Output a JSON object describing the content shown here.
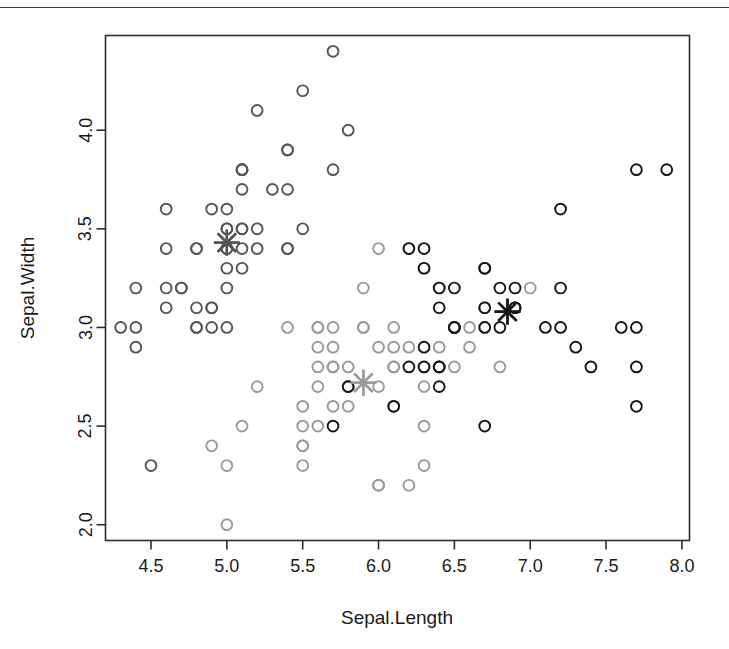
{
  "figure": {
    "background_color": "#ffffff",
    "frame_color": "#2b2b2b",
    "scan_artifact_line": true
  },
  "chart_data": {
    "type": "scatter",
    "title": "",
    "xlabel": "Sepal.Length",
    "ylabel": "Sepal.Width",
    "xlim": [
      4.2,
      8.05
    ],
    "ylim": [
      1.92,
      4.48
    ],
    "xticks": [
      4.5,
      5.0,
      5.5,
      6.0,
      6.5,
      7.0,
      7.5,
      8.0
    ],
    "xtick_labels": [
      "4.5",
      "5.0",
      "5.5",
      "6.0",
      "6.5",
      "7.0",
      "7.5",
      "8.0"
    ],
    "yticks": [
      2.0,
      2.5,
      3.0,
      3.5,
      4.0
    ],
    "ytick_labels": [
      "2.0",
      "2.5",
      "3.0",
      "3.5",
      "4.0"
    ],
    "grid": false,
    "legend": "none",
    "marker": "open-circle",
    "series": [
      {
        "name": "cluster-1",
        "color": "#555555",
        "points": [
          [
            5.1,
            3.5
          ],
          [
            4.9,
            3.0
          ],
          [
            4.7,
            3.2
          ],
          [
            4.6,
            3.1
          ],
          [
            5.0,
            3.6
          ],
          [
            5.4,
            3.9
          ],
          [
            4.6,
            3.4
          ],
          [
            5.0,
            3.4
          ],
          [
            4.4,
            2.9
          ],
          [
            4.9,
            3.1
          ],
          [
            5.4,
            3.7
          ],
          [
            4.8,
            3.4
          ],
          [
            4.8,
            3.0
          ],
          [
            4.3,
            3.0
          ],
          [
            5.8,
            4.0
          ],
          [
            5.7,
            4.4
          ],
          [
            5.4,
            3.9
          ],
          [
            5.1,
            3.5
          ],
          [
            5.7,
            3.8
          ],
          [
            5.1,
            3.8
          ],
          [
            5.4,
            3.4
          ],
          [
            5.1,
            3.7
          ],
          [
            4.6,
            3.6
          ],
          [
            5.1,
            3.3
          ],
          [
            4.8,
            3.4
          ],
          [
            5.0,
            3.0
          ],
          [
            5.0,
            3.4
          ],
          [
            5.2,
            3.5
          ],
          [
            5.2,
            3.4
          ],
          [
            4.7,
            3.2
          ],
          [
            4.8,
            3.1
          ],
          [
            5.4,
            3.4
          ],
          [
            5.2,
            4.1
          ],
          [
            5.5,
            4.2
          ],
          [
            4.9,
            3.1
          ],
          [
            5.0,
            3.2
          ],
          [
            5.5,
            3.5
          ],
          [
            4.9,
            3.6
          ],
          [
            4.4,
            3.0
          ],
          [
            5.1,
            3.4
          ],
          [
            5.0,
            3.5
          ],
          [
            4.5,
            2.3
          ],
          [
            4.4,
            3.2
          ],
          [
            5.0,
            3.5
          ],
          [
            5.1,
            3.8
          ],
          [
            4.8,
            3.0
          ],
          [
            5.1,
            3.8
          ],
          [
            4.6,
            3.2
          ],
          [
            5.3,
            3.7
          ],
          [
            5.0,
            3.3
          ]
        ]
      },
      {
        "name": "cluster-2",
        "color": "#9a9a9a",
        "points": [
          [
            7.0,
            3.2
          ],
          [
            6.4,
            3.2
          ],
          [
            6.9,
            3.1
          ],
          [
            5.5,
            2.3
          ],
          [
            6.5,
            2.8
          ],
          [
            5.7,
            2.8
          ],
          [
            6.3,
            3.3
          ],
          [
            4.9,
            2.4
          ],
          [
            6.6,
            2.9
          ],
          [
            5.2,
            2.7
          ],
          [
            5.0,
            2.0
          ],
          [
            5.9,
            3.0
          ],
          [
            6.0,
            2.2
          ],
          [
            6.1,
            2.9
          ],
          [
            5.6,
            2.9
          ],
          [
            6.7,
            3.1
          ],
          [
            5.6,
            3.0
          ],
          [
            5.8,
            2.7
          ],
          [
            6.2,
            2.2
          ],
          [
            5.6,
            2.5
          ],
          [
            5.9,
            3.2
          ],
          [
            6.1,
            2.8
          ],
          [
            6.3,
            2.5
          ],
          [
            6.1,
            2.8
          ],
          [
            6.4,
            2.9
          ],
          [
            6.6,
            3.0
          ],
          [
            6.8,
            2.8
          ],
          [
            6.7,
            3.0
          ],
          [
            6.0,
            2.9
          ],
          [
            5.7,
            2.6
          ],
          [
            5.5,
            2.4
          ],
          [
            5.5,
            2.4
          ],
          [
            5.8,
            2.7
          ],
          [
            6.0,
            2.7
          ],
          [
            5.4,
            3.0
          ],
          [
            6.0,
            3.4
          ],
          [
            6.7,
            3.1
          ],
          [
            6.3,
            2.3
          ],
          [
            5.6,
            3.0
          ],
          [
            5.5,
            2.5
          ],
          [
            5.5,
            2.6
          ],
          [
            6.1,
            3.0
          ],
          [
            5.8,
            2.6
          ],
          [
            5.0,
            2.3
          ],
          [
            5.6,
            2.7
          ],
          [
            5.7,
            3.0
          ],
          [
            5.7,
            2.9
          ],
          [
            6.2,
            2.9
          ],
          [
            5.1,
            2.5
          ],
          [
            5.7,
            2.8
          ],
          [
            5.8,
            2.7
          ],
          [
            6.3,
            2.7
          ],
          [
            6.0,
            2.2
          ],
          [
            5.6,
            2.8
          ],
          [
            6.3,
            2.8
          ],
          [
            6.1,
            2.6
          ],
          [
            5.8,
            2.8
          ],
          [
            6.2,
            3.4
          ],
          [
            5.9,
            3.0
          ]
        ]
      },
      {
        "name": "cluster-3",
        "color": "#151515",
        "points": [
          [
            6.3,
            3.3
          ],
          [
            5.8,
            2.7
          ],
          [
            7.1,
            3.0
          ],
          [
            6.3,
            2.9
          ],
          [
            6.5,
            3.0
          ],
          [
            7.6,
            3.0
          ],
          [
            7.3,
            2.9
          ],
          [
            6.7,
            2.5
          ],
          [
            7.2,
            3.6
          ],
          [
            6.5,
            3.2
          ],
          [
            6.4,
            2.7
          ],
          [
            6.8,
            3.0
          ],
          [
            5.7,
            2.5
          ],
          [
            6.4,
            3.2
          ],
          [
            6.5,
            3.0
          ],
          [
            7.7,
            3.8
          ],
          [
            7.7,
            2.6
          ],
          [
            6.9,
            3.2
          ],
          [
            7.7,
            2.8
          ],
          [
            6.7,
            3.3
          ],
          [
            7.2,
            3.2
          ],
          [
            6.2,
            2.8
          ],
          [
            6.4,
            2.8
          ],
          [
            7.2,
            3.0
          ],
          [
            7.4,
            2.8
          ],
          [
            7.9,
            3.8
          ],
          [
            6.4,
            2.8
          ],
          [
            6.3,
            2.8
          ],
          [
            6.1,
            2.6
          ],
          [
            7.7,
            3.0
          ],
          [
            6.3,
            3.4
          ],
          [
            6.4,
            3.1
          ],
          [
            6.9,
            3.1
          ],
          [
            6.7,
            3.1
          ],
          [
            6.9,
            3.1
          ],
          [
            6.8,
            3.2
          ],
          [
            6.7,
            3.3
          ],
          [
            6.7,
            3.0
          ],
          [
            6.5,
            3.0
          ],
          [
            6.2,
            3.4
          ]
        ]
      }
    ],
    "centers": [
      {
        "name": "center-cluster-1",
        "x": 5.0,
        "y": 3.43,
        "color": "#555555"
      },
      {
        "name": "center-cluster-2",
        "x": 5.9,
        "y": 2.72,
        "color": "#9a9a9a"
      },
      {
        "name": "center-cluster-3",
        "x": 6.85,
        "y": 3.08,
        "color": "#151515"
      }
    ]
  }
}
